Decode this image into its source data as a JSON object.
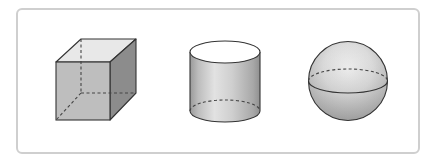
{
  "figure": {
    "frame": {
      "border_color": "#cfcfcf",
      "background": "#ffffff"
    },
    "shapes": [
      {
        "id": "cube",
        "label": "cube",
        "colors": {
          "front": "#b9b9b9",
          "right": "#8c8c8c",
          "top": "#e8e8e8",
          "edge": "#333333",
          "hidden_edge": "#444444"
        }
      },
      {
        "id": "cylinder",
        "label": "cylinder",
        "colors": {
          "side_dark": "#9a9a9a",
          "side_light": "#e2e2e2",
          "top": "#ffffff",
          "edge": "#333333",
          "hidden_edge": "#444444"
        }
      },
      {
        "id": "sphere",
        "label": "sphere",
        "colors": {
          "highlight": "#f2f2f2",
          "shadow": "#9c9c9c",
          "edge": "#333333",
          "hidden_edge": "#444444"
        }
      }
    ]
  }
}
